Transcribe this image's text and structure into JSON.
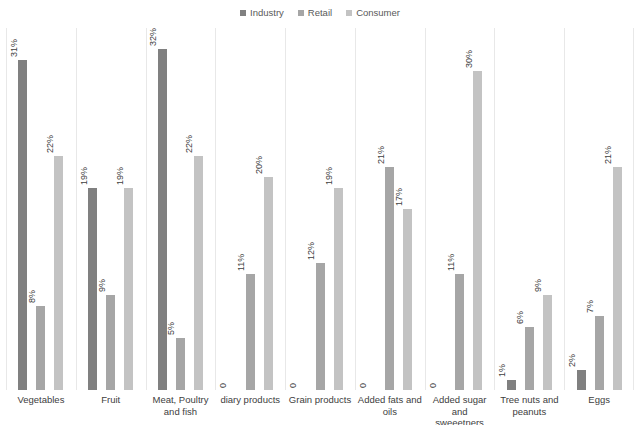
{
  "chart_data": {
    "type": "bar",
    "title": "",
    "subtitle": "",
    "xlabel": "",
    "ylabel": "",
    "ylim": [
      0,
      34
    ],
    "grid": false,
    "legend_position": "top-center",
    "categories": [
      "Vegetables",
      "Fruit",
      "Meat, Poultry and fish",
      "diary products",
      "Grain products",
      "Added fats and oils",
      "Added sugar and sweeetners",
      "Tree nuts and peanuts",
      "Eggs"
    ],
    "series": [
      {
        "name": "Industry",
        "color": "#808080",
        "values": [
          31,
          19,
          32,
          0,
          0,
          0,
          0,
          1,
          2
        ],
        "labels": [
          "31%",
          "19%",
          "32%",
          "0",
          "0",
          "0",
          "0",
          "1%",
          "2%"
        ]
      },
      {
        "name": "Retail",
        "color": "#a6a6a6",
        "values": [
          8,
          9,
          5,
          11,
          12,
          21,
          11,
          6,
          7
        ],
        "labels": [
          "8%",
          "9%",
          "5%",
          "11%",
          "12%",
          "21%",
          "11%",
          "6%",
          "7%"
        ]
      },
      {
        "name": "Consumer",
        "color": "#c3c3c3",
        "values": [
          22,
          19,
          22,
          20,
          19,
          17,
          30,
          9,
          21
        ],
        "labels": [
          "22%",
          "19%",
          "22%",
          "20%",
          "19%",
          "17%",
          "30%",
          "9%",
          "21%"
        ]
      }
    ]
  },
  "legend": {
    "entries": [
      {
        "label": "Industry",
        "color": "#808080"
      },
      {
        "label": "Retail",
        "color": "#a6a6a6"
      },
      {
        "label": "Consumer",
        "color": "#c3c3c3"
      }
    ]
  }
}
